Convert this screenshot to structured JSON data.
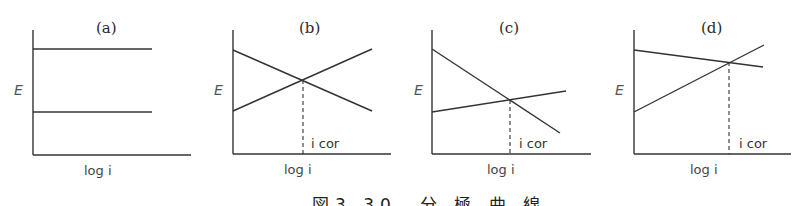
{
  "figure": {
    "caption": "図3.30　分 極 曲 線",
    "panels": [
      {
        "id": "a",
        "label": "(a)",
        "ylabel": "E",
        "xlabel": "log i",
        "icor_label": null,
        "lines": [
          {
            "x1": 33,
            "y1": 49,
            "x2": 152,
            "y2": 49
          },
          {
            "x1": 33,
            "y1": 112,
            "x2": 152,
            "y2": 112
          }
        ],
        "intersection": null
      },
      {
        "id": "b",
        "label": "(b)",
        "ylabel": "E",
        "xlabel": "log i",
        "icor_label": "i cor",
        "lines": [
          {
            "x1": 233,
            "y1": 50,
            "x2": 372,
            "y2": 111
          },
          {
            "x1": 233,
            "y1": 111,
            "x2": 372,
            "y2": 49
          }
        ],
        "intersection": {
          "x": 303,
          "y": 80
        }
      },
      {
        "id": "c",
        "label": "(c)",
        "ylabel": "E",
        "xlabel": "log i",
        "icor_label": "i cor",
        "lines": [
          {
            "x1": 432,
            "y1": 49,
            "x2": 560,
            "y2": 133
          },
          {
            "x1": 432,
            "y1": 112,
            "x2": 566,
            "y2": 91
          }
        ],
        "intersection": {
          "x": 510,
          "y": 100
        }
      },
      {
        "id": "d",
        "label": "(d)",
        "ylabel": "E",
        "xlabel": "log i",
        "icor_label": "i cor",
        "lines": [
          {
            "x1": 634,
            "y1": 50,
            "x2": 763,
            "y2": 67
          },
          {
            "x1": 634,
            "y1": 112,
            "x2": 764,
            "y2": 45
          }
        ],
        "intersection": {
          "x": 729,
          "y": 62
        }
      }
    ]
  }
}
